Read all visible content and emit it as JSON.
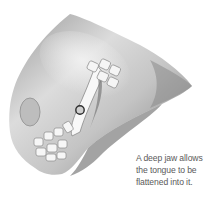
{
  "illustration": {
    "subject": "jaw-diagram",
    "colors": {
      "skin_dark": "#6e6e6e",
      "skin_mid": "#a8a8a8",
      "skin_light": "#e6e6e6",
      "teeth": "#f4f4f4",
      "marker": "#333333"
    }
  },
  "caption": {
    "lines": [
      "A deep jaw allows",
      "the tongue to be",
      "flattened into it."
    ]
  }
}
